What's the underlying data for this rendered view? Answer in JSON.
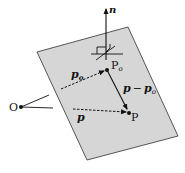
{
  "diagram": {
    "type": "vector-plane-diagram",
    "colors": {
      "plane_fill": "#d6d6d6",
      "plane_edge": "#555555",
      "ink": "#111111",
      "background": "#ffffff"
    },
    "labels": {
      "normal": "n",
      "p0_point": "P",
      "p0_point_sub": "o",
      "p_point": "P",
      "origin": "O",
      "vec_p0": "p",
      "vec_p0_sub": "o",
      "vec_p": "p",
      "vec_diff_a": "p",
      "vec_diff_op": "−",
      "vec_diff_b": "p",
      "vec_diff_b_sub": "o"
    },
    "plane_corners": [
      [
        37,
        52
      ],
      [
        128,
        27
      ],
      [
        178,
        136
      ],
      [
        87,
        160
      ]
    ],
    "points": {
      "O": [
        21,
        107
      ],
      "P0": [
        107,
        70
      ],
      "P": [
        129,
        113
      ]
    }
  }
}
